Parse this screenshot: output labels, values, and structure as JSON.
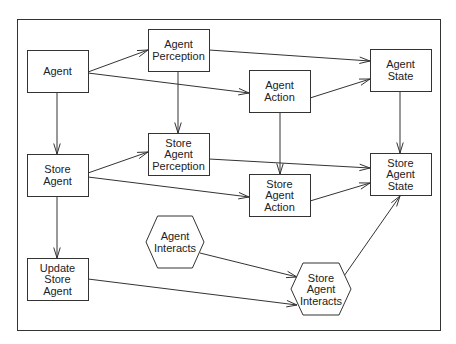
{
  "diagram": {
    "frame": {
      "x": 17,
      "y": 19,
      "w": 423,
      "h": 311
    },
    "nodes": [
      {
        "id": "agent",
        "shape": "rect",
        "x": 27,
        "y": 50,
        "w": 61,
        "h": 42,
        "lines": [
          "Agent"
        ]
      },
      {
        "id": "agent-perception",
        "shape": "rect",
        "x": 148,
        "y": 29,
        "w": 61,
        "h": 42,
        "lines": [
          "Agent",
          "Perception"
        ]
      },
      {
        "id": "agent-action",
        "shape": "rect",
        "x": 249,
        "y": 70,
        "w": 61,
        "h": 42,
        "lines": [
          "Agent",
          "Action"
        ]
      },
      {
        "id": "agent-state",
        "shape": "rect",
        "x": 370,
        "y": 49,
        "w": 61,
        "h": 42,
        "lines": [
          "Agent",
          "State"
        ]
      },
      {
        "id": "store-agent",
        "shape": "rect",
        "x": 27,
        "y": 154,
        "w": 61,
        "h": 42,
        "lines": [
          "Store",
          "Agent"
        ]
      },
      {
        "id": "store-agent-perception",
        "shape": "rect",
        "x": 148,
        "y": 133,
        "w": 61,
        "h": 42,
        "lines": [
          "Store",
          "Agent",
          "Perception"
        ]
      },
      {
        "id": "store-agent-action",
        "shape": "rect",
        "x": 249,
        "y": 174,
        "w": 61,
        "h": 42,
        "lines": [
          "Store",
          "Agent",
          "Action"
        ]
      },
      {
        "id": "store-agent-state",
        "shape": "rect",
        "x": 370,
        "y": 153,
        "w": 61,
        "h": 42,
        "lines": [
          "Store",
          "Agent",
          "State"
        ]
      },
      {
        "id": "update-store-agent",
        "shape": "rect",
        "x": 27,
        "y": 258,
        "w": 61,
        "h": 42,
        "lines": [
          "Update",
          "Store",
          "Agent"
        ]
      },
      {
        "id": "agent-interacts",
        "shape": "hexagon",
        "x": 146,
        "y": 216,
        "w": 58,
        "h": 52,
        "lines": [
          "Agent",
          "Interacts"
        ]
      },
      {
        "id": "store-agent-interacts",
        "shape": "hexagon",
        "x": 291,
        "y": 263,
        "w": 60,
        "h": 52,
        "lines": [
          "Store",
          "Agent",
          "Interacts"
        ]
      }
    ],
    "edges": [
      {
        "from": "agent",
        "to": "agent-perception",
        "points": [
          88,
          72,
          148,
          50
        ]
      },
      {
        "from": "agent",
        "to": "agent-action",
        "points": [
          88,
          73,
          249,
          93
        ]
      },
      {
        "from": "agent",
        "to": "store-agent",
        "points": [
          57,
          92,
          57,
          154
        ]
      },
      {
        "from": "agent-perception",
        "to": "agent-state",
        "points": [
          209,
          50,
          370,
          61
        ]
      },
      {
        "from": "agent-perception",
        "to": "store-agent-perception",
        "points": [
          178,
          71,
          178,
          133
        ]
      },
      {
        "from": "agent-action",
        "to": "agent-state",
        "points": [
          310,
          98,
          370,
          79
        ]
      },
      {
        "from": "agent-action",
        "to": "store-agent-action",
        "points": [
          280,
          112,
          280,
          174
        ]
      },
      {
        "from": "agent-state",
        "to": "store-agent-state",
        "points": [
          400,
          91,
          400,
          153
        ]
      },
      {
        "from": "store-agent",
        "to": "store-agent-perception",
        "points": [
          88,
          173,
          148,
          152
        ]
      },
      {
        "from": "store-agent",
        "to": "store-agent-action",
        "points": [
          88,
          177,
          249,
          197
        ]
      },
      {
        "from": "store-agent",
        "to": "update-store-agent",
        "points": [
          57,
          196,
          57,
          258
        ]
      },
      {
        "from": "store-agent-perception",
        "to": "store-agent-state",
        "points": [
          209,
          159,
          370,
          168
        ]
      },
      {
        "from": "store-agent-action",
        "to": "store-agent-state",
        "points": [
          310,
          201,
          370,
          183
        ]
      },
      {
        "from": "agent-interacts",
        "to": "store-agent-interacts",
        "points": [
          200,
          253,
          297,
          277
        ]
      },
      {
        "from": "update-store-agent",
        "to": "store-agent-interacts",
        "points": [
          88,
          279,
          297,
          305
        ]
      },
      {
        "from": "store-agent-interacts",
        "to": "store-agent-state",
        "points": [
          344,
          276,
          400,
          196
        ]
      }
    ],
    "colors": {
      "stroke": "#333333",
      "text": "#222222",
      "background": "#ffffff"
    }
  }
}
